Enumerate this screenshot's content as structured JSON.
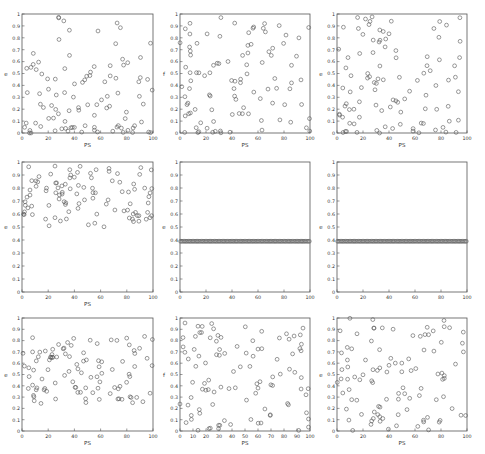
{
  "figure": {
    "layout": "3x3 grid of scatter plots",
    "rows": 3,
    "cols": 3
  },
  "chart_data": [
    {
      "id": "r1c1",
      "type": "scatter",
      "title": "",
      "xlabel": "PS",
      "ylabel": "e",
      "xlim": [
        0,
        100
      ],
      "ylim": [
        0,
        1
      ],
      "xticks": [
        0,
        20,
        40,
        60,
        80,
        100
      ],
      "yticks": [
        0,
        0.1,
        0.2,
        0.3,
        0.4,
        0.5,
        0.6,
        0.7,
        0.8,
        0.9,
        1
      ],
      "grid": false,
      "marker": "open-circle",
      "distribution": "sparse, mostly below 0.45, few high outliers",
      "generator": {
        "kind": "lowskew",
        "seed": 11,
        "n": 100
      }
    },
    {
      "id": "r1c2",
      "type": "scatter",
      "title": "",
      "xlabel": "PS",
      "ylabel": "f",
      "xlim": [
        0,
        100
      ],
      "ylim": [
        0,
        1
      ],
      "xticks": [
        0,
        20,
        40,
        60,
        80,
        100
      ],
      "yticks": [
        0,
        0.1,
        0.2,
        0.3,
        0.4,
        0.5,
        0.6,
        0.7,
        0.8,
        0.9,
        1
      ],
      "grid": false,
      "marker": "open-circle",
      "distribution": "spread 0-0.95, denser below 0.5",
      "generator": {
        "kind": "lowskew",
        "seed": 23,
        "n": 100
      }
    },
    {
      "id": "r1c3",
      "type": "scatter",
      "title": "",
      "xlabel": "PS",
      "ylabel": "e",
      "xlim": [
        0,
        100
      ],
      "ylim": [
        0,
        1
      ],
      "xticks": [
        0,
        20,
        40,
        60,
        80,
        100
      ],
      "yticks": [
        0,
        0.1,
        0.2,
        0.3,
        0.4,
        0.5,
        0.6,
        0.7,
        0.8,
        0.9,
        1
      ],
      "grid": false,
      "marker": "open-circle",
      "distribution": "spread 0-1, denser below 0.45",
      "generator": {
        "kind": "lowskew",
        "seed": 37,
        "n": 100
      }
    },
    {
      "id": "r2c1",
      "type": "scatter",
      "title": "",
      "xlabel": "PS",
      "ylabel": "e",
      "xlim": [
        0,
        100
      ],
      "ylim": [
        0,
        1
      ],
      "xticks": [
        0,
        20,
        40,
        60,
        80,
        100
      ],
      "yticks": [
        0,
        0.1,
        0.2,
        0.3,
        0.4,
        0.5,
        0.6,
        0.7,
        0.8,
        0.9,
        1
      ],
      "grid": false,
      "marker": "open-circle",
      "distribution": "dense band 0.5-0.97",
      "generator": {
        "kind": "band",
        "lo": 0.5,
        "hi": 0.97,
        "seed": 41,
        "n": 100
      }
    },
    {
      "id": "r2c2",
      "type": "scatter",
      "title": "",
      "xlabel": "",
      "ylabel": "e",
      "xlim": [
        0,
        100
      ],
      "ylim": [
        0,
        1
      ],
      "xticks": [
        0,
        20,
        40,
        60,
        80,
        100
      ],
      "yticks": [
        0,
        0.1,
        0.2,
        0.3,
        0.4,
        0.5,
        0.6,
        0.7,
        0.8,
        0.9,
        1
      ],
      "grid": false,
      "marker": "open-circle",
      "distribution": "constant ~0.39",
      "generator": {
        "kind": "constant",
        "value": 0.39,
        "n": 100
      }
    },
    {
      "id": "r2c3",
      "type": "scatter",
      "title": "",
      "xlabel": "",
      "ylabel": "e",
      "xlim": [
        0,
        100
      ],
      "ylim": [
        0,
        1
      ],
      "xticks": [
        0,
        20,
        40,
        60,
        80,
        100
      ],
      "yticks": [
        0,
        0.1,
        0.2,
        0.3,
        0.4,
        0.5,
        0.6,
        0.7,
        0.8,
        0.9,
        1
      ],
      "grid": false,
      "marker": "open-circle",
      "distribution": "constant ~0.39",
      "generator": {
        "kind": "constant",
        "value": 0.39,
        "n": 100
      }
    },
    {
      "id": "r3c1",
      "type": "scatter",
      "title": "",
      "xlabel": "PS",
      "ylabel": "e",
      "xlim": [
        0,
        100
      ],
      "ylim": [
        0,
        1
      ],
      "xticks": [
        0,
        20,
        40,
        60,
        80,
        100
      ],
      "yticks": [
        0,
        0.1,
        0.2,
        0.3,
        0.4,
        0.5,
        0.6,
        0.7,
        0.8,
        0.9,
        1
      ],
      "grid": false,
      "marker": "open-circle",
      "distribution": "band 0.23-0.85",
      "generator": {
        "kind": "band",
        "lo": 0.23,
        "hi": 0.85,
        "seed": 53,
        "n": 100
      }
    },
    {
      "id": "r3c2",
      "type": "scatter",
      "title": "",
      "xlabel": "PS",
      "ylabel": "f",
      "xlim": [
        0,
        100
      ],
      "ylim": [
        0,
        1
      ],
      "xticks": [
        0,
        10,
        20,
        30,
        40,
        50,
        60,
        70,
        80,
        90,
        100
      ],
      "yticks": [
        0,
        0.1,
        0.2,
        0.3,
        0.4,
        0.5,
        0.6,
        0.7,
        0.8,
        0.9,
        1
      ],
      "grid": false,
      "marker": "open-circle",
      "distribution": "uniform 0-1",
      "generator": {
        "kind": "band",
        "lo": 0.0,
        "hi": 0.97,
        "seed": 67,
        "n": 100
      }
    },
    {
      "id": "r3c3",
      "type": "scatter",
      "title": "",
      "xlabel": "PS",
      "ylabel": "e",
      "xlim": [
        0,
        100
      ],
      "ylim": [
        0,
        1
      ],
      "xticks": [
        0,
        20,
        40,
        60,
        80,
        100
      ],
      "yticks": [
        0,
        0.1,
        0.2,
        0.3,
        0.4,
        0.5,
        0.6,
        0.7,
        0.8,
        0.9,
        1
      ],
      "grid": false,
      "marker": "open-circle",
      "distribution": "uniform 0-1",
      "generator": {
        "kind": "band",
        "lo": 0.0,
        "hi": 1.0,
        "seed": 79,
        "n": 100
      }
    }
  ],
  "panels_geometry": [
    {
      "left": 22,
      "top": 14,
      "right": 153,
      "bottom": 133
    },
    {
      "left": 180,
      "top": 14,
      "right": 310,
      "bottom": 133
    },
    {
      "left": 337,
      "top": 14,
      "right": 467,
      "bottom": 133
    },
    {
      "left": 22,
      "top": 162,
      "right": 153,
      "bottom": 292
    },
    {
      "left": 180,
      "top": 162,
      "right": 310,
      "bottom": 292
    },
    {
      "left": 337,
      "top": 162,
      "right": 467,
      "bottom": 292
    },
    {
      "left": 22,
      "top": 318,
      "right": 153,
      "bottom": 431
    },
    {
      "left": 180,
      "top": 318,
      "right": 310,
      "bottom": 431
    },
    {
      "left": 337,
      "top": 318,
      "right": 467,
      "bottom": 431
    }
  ],
  "style": {
    "axis_color": "#555555",
    "marker_color": "#555555",
    "text_color": "#333333",
    "background": "#ffffff"
  }
}
